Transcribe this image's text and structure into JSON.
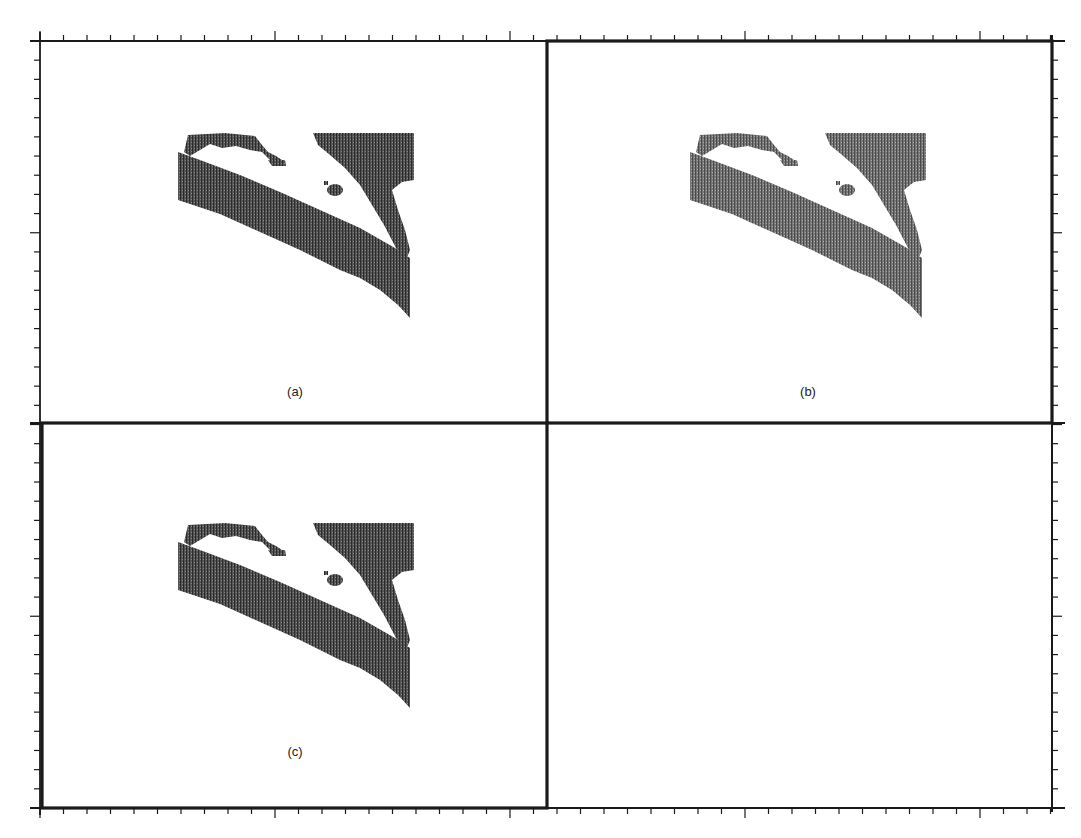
{
  "figure": {
    "panels": [
      {
        "id": "a",
        "label": "(a)",
        "border": "thin",
        "blob_shade": "#3a3a3a",
        "label_x": 295,
        "label_y": 384
      },
      {
        "id": "b",
        "label": "(b)",
        "border": "thick",
        "blob_shade": "#5a5a5a",
        "label_x": 808,
        "label_y": 384
      },
      {
        "id": "c",
        "label": "(c)",
        "border": "thick",
        "blob_shade": "#3d3d3d",
        "label_x": 295,
        "label_y": 744
      },
      {
        "id": "d",
        "label": "",
        "border": "thin",
        "blob_shade": "",
        "label_x": 0,
        "label_y": 0
      }
    ],
    "frame": {
      "left": 40,
      "top": 41,
      "right": 1052,
      "bottom": 808,
      "mid_x": 547,
      "mid_y": 423
    },
    "tick_spacing_px": 23.5,
    "major_tick_every": 10,
    "colors": {
      "ink": "#1a1a1a",
      "background": "#ffffff"
    }
  }
}
